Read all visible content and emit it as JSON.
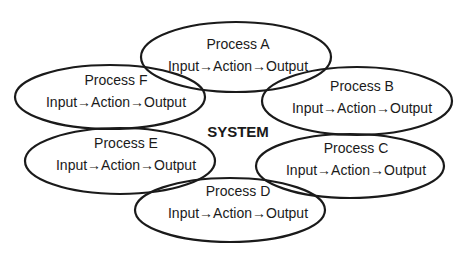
{
  "diagram": {
    "center_label": "SYSTEM",
    "stroke_color": "#1a1a1a",
    "background": "#ffffff",
    "processes": [
      {
        "id": "A",
        "title": "Process A",
        "flow": "Input→Action→Output",
        "cx": 236,
        "cy": 57,
        "rx": 95,
        "ry": 35
      },
      {
        "id": "B",
        "title": "Process B",
        "flow": "Input→Action→Output",
        "cx": 357,
        "cy": 101,
        "rx": 95,
        "ry": 34
      },
      {
        "id": "C",
        "title": "Process C",
        "flow": "Input→Action→Output",
        "cx": 350,
        "cy": 166,
        "rx": 94,
        "ry": 32
      },
      {
        "id": "D",
        "title": "Process D",
        "flow": "Input→Action→Output",
        "cx": 230,
        "cy": 210,
        "rx": 95,
        "ry": 32
      },
      {
        "id": "E",
        "title": "Process E",
        "flow": "Input→Action→Output",
        "cx": 120,
        "cy": 161,
        "rx": 95,
        "ry": 33
      },
      {
        "id": "F",
        "title": "Process F",
        "flow": "Input→Action→Output",
        "cx": 110,
        "cy": 97,
        "rx": 95,
        "ry": 32
      }
    ]
  }
}
